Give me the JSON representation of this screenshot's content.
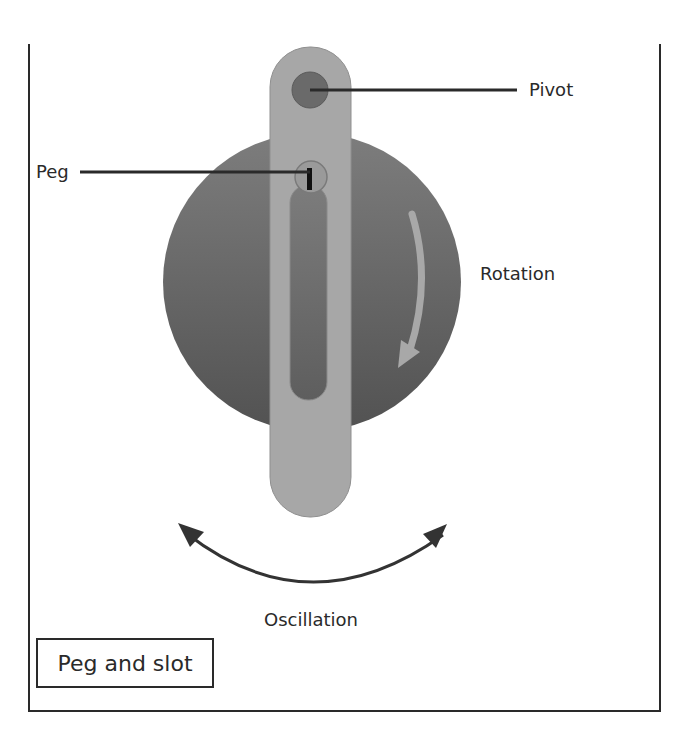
{
  "diagram": {
    "title": "Peg and slot",
    "labels": {
      "pivot": "Pivot",
      "peg": "Peg",
      "rotation": "Rotation",
      "oscillation": "Oscillation"
    },
    "colors": {
      "disc_top": "#7a7a7a",
      "disc_bottom": "#555555",
      "arm": "#a6a6a6",
      "pivot": "#6e6e6e",
      "slot": "#6a6a6a",
      "rotation_arrow": "#a8a8a8",
      "oscillation_arrow": "#333333",
      "line": "#2a2a2a"
    }
  }
}
